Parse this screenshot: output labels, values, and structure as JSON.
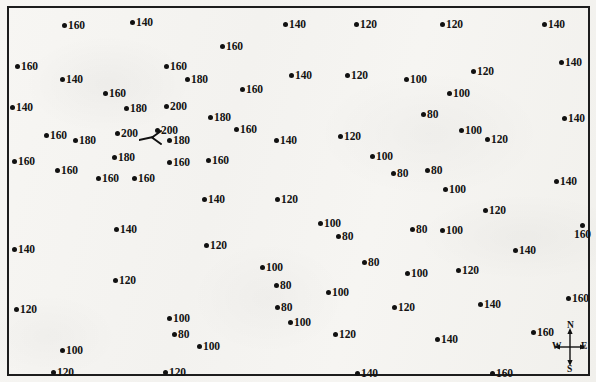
{
  "map": {
    "title": "spot-height-point-map",
    "frame": {
      "border_color": "#1d1d1d"
    },
    "background_color": "#f5f4f1",
    "dot_color": "#111111",
    "label_color": "#131313"
  },
  "compass": {
    "north": "N",
    "south": "S",
    "east": "E",
    "west": "W"
  },
  "chart_data": {
    "type": "scatter",
    "title": "",
    "subtitle": "",
    "xlabel": "",
    "ylabel": "",
    "grid": false,
    "legend": "none",
    "annotations": [
      "compass rose (N/S/E/W) at lower right",
      "leader line with arrowhead near center-left"
    ],
    "value_unit": "elevation",
    "values_present": [
      80,
      100,
      120,
      140,
      160,
      180,
      200
    ],
    "points": [
      {
        "x": 62,
        "y": 16,
        "value": 160,
        "label_pos": "right"
      },
      {
        "x": 130,
        "y": 13,
        "value": 140,
        "label_pos": "right"
      },
      {
        "x": 283,
        "y": 15,
        "value": 140,
        "label_pos": "right"
      },
      {
        "x": 354,
        "y": 15,
        "value": 120,
        "label_pos": "right"
      },
      {
        "x": 440,
        "y": 15,
        "value": 120,
        "label_pos": "right"
      },
      {
        "x": 542,
        "y": 15,
        "value": 140,
        "label_pos": "right"
      },
      {
        "x": 220,
        "y": 37,
        "value": 160,
        "label_pos": "right"
      },
      {
        "x": 15,
        "y": 57,
        "value": 160,
        "label_pos": "right"
      },
      {
        "x": 60,
        "y": 70,
        "value": 140,
        "label_pos": "right"
      },
      {
        "x": 164,
        "y": 57,
        "value": 160,
        "label_pos": "right"
      },
      {
        "x": 185,
        "y": 70,
        "value": 180,
        "label_pos": "right"
      },
      {
        "x": 289,
        "y": 66,
        "value": 140,
        "label_pos": "right"
      },
      {
        "x": 345,
        "y": 66,
        "value": 120,
        "label_pos": "right"
      },
      {
        "x": 404,
        "y": 70,
        "value": 100,
        "label_pos": "right"
      },
      {
        "x": 471,
        "y": 62,
        "value": 120,
        "label_pos": "right"
      },
      {
        "x": 559,
        "y": 53,
        "value": 140,
        "label_pos": "right"
      },
      {
        "x": 103,
        "y": 84,
        "value": 160,
        "label_pos": "right"
      },
      {
        "x": 240,
        "y": 80,
        "value": 160,
        "label_pos": "right"
      },
      {
        "x": 447,
        "y": 84,
        "value": 100,
        "label_pos": "right"
      },
      {
        "x": 10,
        "y": 98,
        "value": 140,
        "label_pos": "right"
      },
      {
        "x": 124,
        "y": 99,
        "value": 180,
        "label_pos": "right"
      },
      {
        "x": 164,
        "y": 97,
        "value": 200,
        "label_pos": "right"
      },
      {
        "x": 421,
        "y": 105,
        "value": 80,
        "label_pos": "right"
      },
      {
        "x": 562,
        "y": 109,
        "value": 140,
        "label_pos": "right"
      },
      {
        "x": 208,
        "y": 108,
        "value": 180,
        "label_pos": "right"
      },
      {
        "x": 44,
        "y": 126,
        "value": 160,
        "label_pos": "right"
      },
      {
        "x": 73,
        "y": 131,
        "value": 180,
        "label_pos": "right"
      },
      {
        "x": 115,
        "y": 124,
        "value": 200,
        "label_pos": "right"
      },
      {
        "x": 155,
        "y": 121,
        "value": 200,
        "label_pos": "right"
      },
      {
        "x": 167,
        "y": 131,
        "value": 180,
        "label_pos": "right"
      },
      {
        "x": 234,
        "y": 120,
        "value": 160,
        "label_pos": "right"
      },
      {
        "x": 274,
        "y": 131,
        "value": 140,
        "label_pos": "right"
      },
      {
        "x": 338,
        "y": 127,
        "value": 120,
        "label_pos": "right"
      },
      {
        "x": 459,
        "y": 121,
        "value": 100,
        "label_pos": "right"
      },
      {
        "x": 485,
        "y": 130,
        "value": 120,
        "label_pos": "right"
      },
      {
        "x": 12,
        "y": 152,
        "value": 160,
        "label_pos": "right"
      },
      {
        "x": 112,
        "y": 148,
        "value": 180,
        "label_pos": "right"
      },
      {
        "x": 167,
        "y": 153,
        "value": 160,
        "label_pos": "right"
      },
      {
        "x": 206,
        "y": 151,
        "value": 160,
        "label_pos": "right"
      },
      {
        "x": 370,
        "y": 147,
        "value": 100,
        "label_pos": "right"
      },
      {
        "x": 391,
        "y": 164,
        "value": 80,
        "label_pos": "right"
      },
      {
        "x": 425,
        "y": 161,
        "value": 80,
        "label_pos": "right"
      },
      {
        "x": 55,
        "y": 161,
        "value": 160,
        "label_pos": "right"
      },
      {
        "x": 96,
        "y": 169,
        "value": 160,
        "label_pos": "right"
      },
      {
        "x": 132,
        "y": 169,
        "value": 160,
        "label_pos": "right"
      },
      {
        "x": 443,
        "y": 180,
        "value": 100,
        "label_pos": "right"
      },
      {
        "x": 554,
        "y": 172,
        "value": 140,
        "label_pos": "right"
      },
      {
        "x": 202,
        "y": 190,
        "value": 140,
        "label_pos": "right"
      },
      {
        "x": 275,
        "y": 190,
        "value": 120,
        "label_pos": "right"
      },
      {
        "x": 483,
        "y": 201,
        "value": 120,
        "label_pos": "right"
      },
      {
        "x": 114,
        "y": 220,
        "value": 140,
        "label_pos": "right"
      },
      {
        "x": 318,
        "y": 214,
        "value": 100,
        "label_pos": "right"
      },
      {
        "x": 336,
        "y": 227,
        "value": 80,
        "label_pos": "right"
      },
      {
        "x": 410,
        "y": 220,
        "value": 80,
        "label_pos": "right"
      },
      {
        "x": 440,
        "y": 221,
        "value": 100,
        "label_pos": "right"
      },
      {
        "x": 574,
        "y": 223,
        "value": 160,
        "label_pos": "below"
      },
      {
        "x": 204,
        "y": 236,
        "value": 120,
        "label_pos": "right"
      },
      {
        "x": 12,
        "y": 240,
        "value": 140,
        "label_pos": "right"
      },
      {
        "x": 513,
        "y": 241,
        "value": 140,
        "label_pos": "right"
      },
      {
        "x": 260,
        "y": 258,
        "value": 100,
        "label_pos": "right"
      },
      {
        "x": 362,
        "y": 253,
        "value": 80,
        "label_pos": "right"
      },
      {
        "x": 405,
        "y": 264,
        "value": 100,
        "label_pos": "right"
      },
      {
        "x": 456,
        "y": 261,
        "value": 120,
        "label_pos": "right"
      },
      {
        "x": 113,
        "y": 271,
        "value": 120,
        "label_pos": "right"
      },
      {
        "x": 274,
        "y": 276,
        "value": 80,
        "label_pos": "right"
      },
      {
        "x": 326,
        "y": 283,
        "value": 100,
        "label_pos": "right"
      },
      {
        "x": 566,
        "y": 289,
        "value": 160,
        "label_pos": "right"
      },
      {
        "x": 14,
        "y": 300,
        "value": 120,
        "label_pos": "right"
      },
      {
        "x": 275,
        "y": 298,
        "value": 80,
        "label_pos": "right"
      },
      {
        "x": 288,
        "y": 313,
        "value": 100,
        "label_pos": "right"
      },
      {
        "x": 392,
        "y": 298,
        "value": 120,
        "label_pos": "right"
      },
      {
        "x": 478,
        "y": 295,
        "value": 140,
        "label_pos": "right"
      },
      {
        "x": 167,
        "y": 309,
        "value": 100,
        "label_pos": "right"
      },
      {
        "x": 172,
        "y": 325,
        "value": 80,
        "label_pos": "right"
      },
      {
        "x": 197,
        "y": 337,
        "value": 100,
        "label_pos": "right"
      },
      {
        "x": 333,
        "y": 325,
        "value": 120,
        "label_pos": "right"
      },
      {
        "x": 435,
        "y": 330,
        "value": 140,
        "label_pos": "right"
      },
      {
        "x": 531,
        "y": 323,
        "value": 160,
        "label_pos": "right"
      },
      {
        "x": 60,
        "y": 341,
        "value": 100,
        "label_pos": "right"
      },
      {
        "x": 51,
        "y": 363,
        "value": 120,
        "label_pos": "right"
      },
      {
        "x": 163,
        "y": 363,
        "value": 120,
        "label_pos": "right"
      },
      {
        "x": 355,
        "y": 364,
        "value": 140,
        "label_pos": "right"
      },
      {
        "x": 490,
        "y": 364,
        "value": 160,
        "label_pos": "right"
      }
    ]
  }
}
